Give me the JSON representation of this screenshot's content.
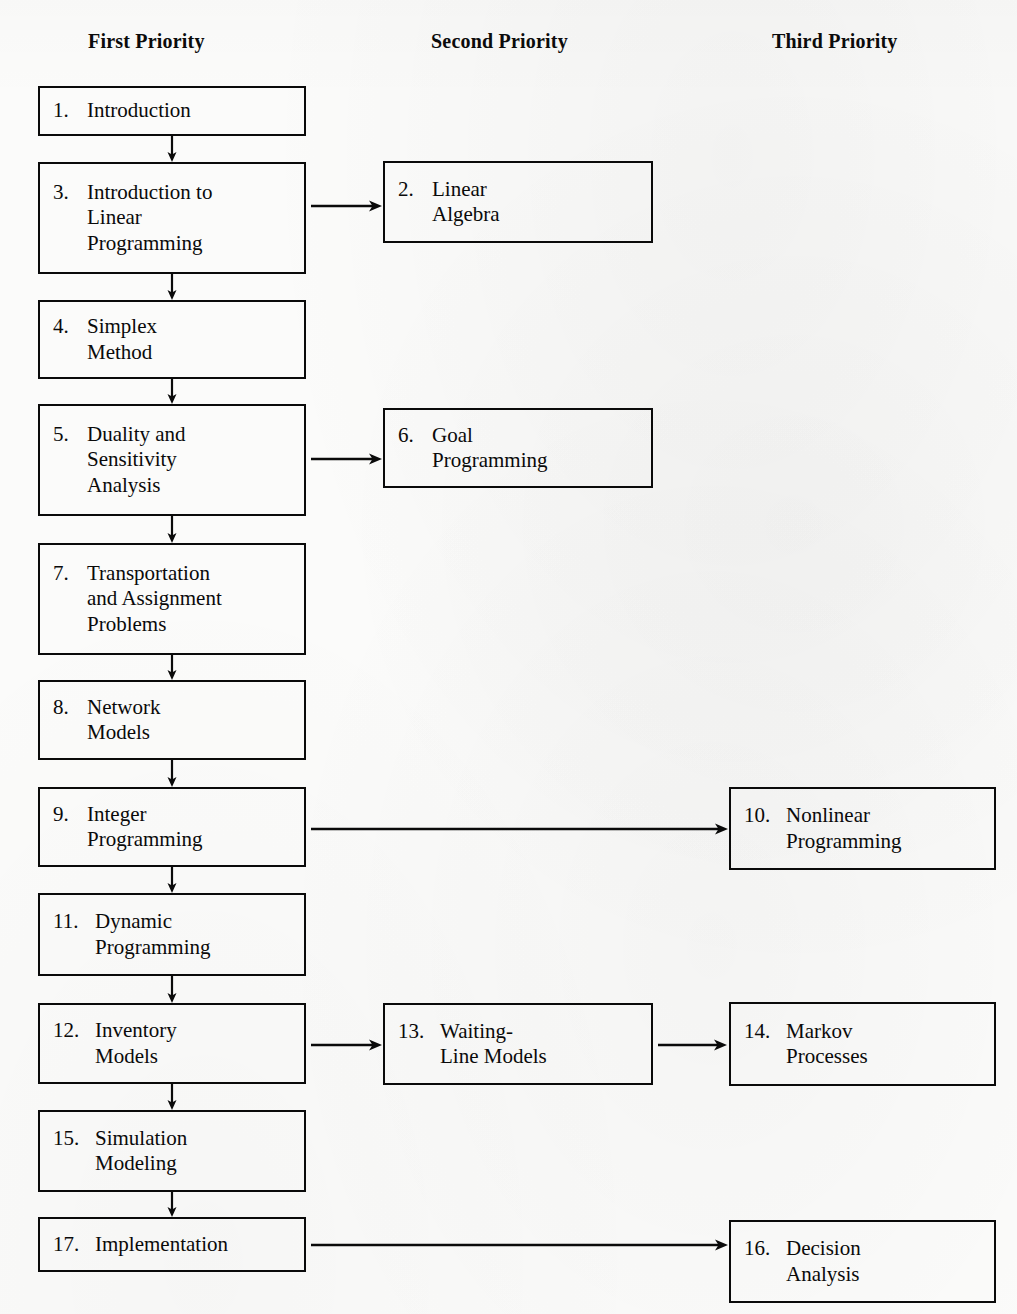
{
  "headers": [
    {
      "label": "First Priority",
      "x": 88,
      "y": 30
    },
    {
      "label": "Second Priority",
      "x": 431,
      "y": 30
    },
    {
      "label": "Third Priority",
      "x": 772,
      "y": 30
    }
  ],
  "nodes": [
    {
      "id": "n1",
      "num": "1.",
      "title": "Introduction",
      "column": "first",
      "x": 38,
      "y": 86,
      "w": 268,
      "h": 50
    },
    {
      "id": "n3",
      "num": "3.",
      "title": "Introduction to\nLinear\nProgramming",
      "column": "first",
      "x": 38,
      "y": 162,
      "w": 268,
      "h": 112
    },
    {
      "id": "n4",
      "num": "4.",
      "title": "Simplex\nMethod",
      "column": "first",
      "x": 38,
      "y": 300,
      "w": 268,
      "h": 79
    },
    {
      "id": "n5",
      "num": "5.",
      "title": "Duality and\nSensitivity\nAnalysis",
      "column": "first",
      "x": 38,
      "y": 404,
      "w": 268,
      "h": 112
    },
    {
      "id": "n7",
      "num": "7.",
      "title": "Transportation\nand Assignment\nProblems",
      "column": "first",
      "x": 38,
      "y": 543,
      "w": 268,
      "h": 112
    },
    {
      "id": "n8",
      "num": "8.",
      "title": "Network\nModels",
      "column": "first",
      "x": 38,
      "y": 680,
      "w": 268,
      "h": 80
    },
    {
      "id": "n9",
      "num": "9.",
      "title": "Integer\nProgramming",
      "column": "first",
      "x": 38,
      "y": 787,
      "w": 268,
      "h": 80
    },
    {
      "id": "n11",
      "num": "11.",
      "title": "Dynamic\nProgramming",
      "column": "first",
      "x": 38,
      "y": 893,
      "w": 268,
      "h": 83
    },
    {
      "id": "n12",
      "num": "12.",
      "title": "Inventory\nModels",
      "column": "first",
      "x": 38,
      "y": 1003,
      "w": 268,
      "h": 81
    },
    {
      "id": "n15",
      "num": "15.",
      "title": "Simulation\nModeling",
      "column": "first",
      "x": 38,
      "y": 1110,
      "w": 268,
      "h": 82
    },
    {
      "id": "n17",
      "num": "17.",
      "title": "Implementation",
      "column": "first",
      "x": 38,
      "y": 1217,
      "w": 268,
      "h": 55
    },
    {
      "id": "n2",
      "num": "2.",
      "title": "Linear\nAlgebra",
      "column": "second",
      "x": 383,
      "y": 161,
      "w": 270,
      "h": 82
    },
    {
      "id": "n6",
      "num": "6.",
      "title": "Goal\nProgramming",
      "column": "second",
      "x": 383,
      "y": 408,
      "w": 270,
      "h": 80
    },
    {
      "id": "n13",
      "num": "13.",
      "title": "Waiting-\nLine Models",
      "column": "second",
      "x": 383,
      "y": 1003,
      "w": 270,
      "h": 82
    },
    {
      "id": "n10",
      "num": "10.",
      "title": "Nonlinear\nProgramming",
      "column": "third",
      "x": 729,
      "y": 787,
      "w": 267,
      "h": 83
    },
    {
      "id": "n14",
      "num": "14.",
      "title": "Markov\nProcesses",
      "column": "third",
      "x": 729,
      "y": 1002,
      "w": 267,
      "h": 84
    },
    {
      "id": "n16",
      "num": "16.",
      "title": "Decision\nAnalysis",
      "column": "third",
      "x": 729,
      "y": 1220,
      "w": 267,
      "h": 83
    }
  ],
  "connections": [
    {
      "from": "n1",
      "to": "n3",
      "kind": "vertical",
      "x": 172,
      "y1": 136,
      "y2": 162
    },
    {
      "from": "n3",
      "to": "n4",
      "kind": "vertical",
      "x": 172,
      "y1": 274,
      "y2": 300
    },
    {
      "from": "n4",
      "to": "n5",
      "kind": "vertical",
      "x": 172,
      "y1": 379,
      "y2": 404
    },
    {
      "from": "n5",
      "to": "n7",
      "kind": "vertical",
      "x": 172,
      "y1": 516,
      "y2": 543
    },
    {
      "from": "n7",
      "to": "n8",
      "kind": "vertical",
      "x": 172,
      "y1": 655,
      "y2": 680
    },
    {
      "from": "n8",
      "to": "n9",
      "kind": "vertical",
      "x": 172,
      "y1": 760,
      "y2": 787
    },
    {
      "from": "n9",
      "to": "n11",
      "kind": "vertical",
      "x": 172,
      "y1": 867,
      "y2": 893
    },
    {
      "from": "n11",
      "to": "n12",
      "kind": "vertical",
      "x": 172,
      "y1": 976,
      "y2": 1003
    },
    {
      "from": "n12",
      "to": "n15",
      "kind": "vertical",
      "x": 172,
      "y1": 1084,
      "y2": 1110
    },
    {
      "from": "n15",
      "to": "n17",
      "kind": "vertical",
      "x": 172,
      "y1": 1192,
      "y2": 1217
    },
    {
      "from": "n3",
      "to": "n2",
      "kind": "horizontal",
      "y": 206,
      "x1": 311,
      "x2": 382
    },
    {
      "from": "n5",
      "to": "n6",
      "kind": "horizontal",
      "y": 459,
      "x1": 311,
      "x2": 382
    },
    {
      "from": "n9",
      "to": "n10",
      "kind": "horizontal",
      "y": 829,
      "x1": 311,
      "x2": 728
    },
    {
      "from": "n12",
      "to": "n13",
      "kind": "horizontal",
      "y": 1045,
      "x1": 311,
      "x2": 382
    },
    {
      "from": "n13",
      "to": "n14",
      "kind": "horizontal",
      "y": 1045,
      "x1": 658,
      "x2": 727
    },
    {
      "from": "n17",
      "to": "n16",
      "kind": "horizontal",
      "y": 1245,
      "x1": 311,
      "x2": 728
    }
  ],
  "style": {
    "ink": "#0a0a0a",
    "paper": "#fbfbfa"
  }
}
